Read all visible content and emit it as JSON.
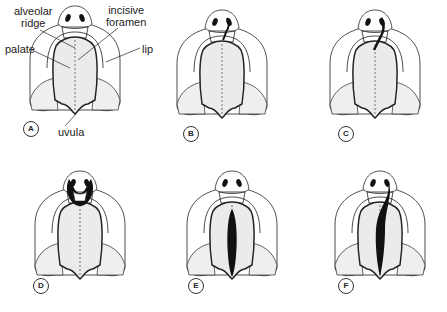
{
  "figure": {
    "panels": [
      {
        "id": "A",
        "label": "A",
        "cx": 75,
        "cy": 60,
        "cleft": "none",
        "letter_pos": [
          23,
          121
        ]
      },
      {
        "id": "B",
        "label": "B",
        "cx": 222,
        "cy": 64,
        "cleft": "unilateral-lip-incomplete",
        "letter_pos": [
          183,
          126
        ]
      },
      {
        "id": "C",
        "label": "C",
        "cx": 375,
        "cy": 64,
        "cleft": "unilateral-lip-and-alveolus",
        "letter_pos": [
          338,
          126
        ]
      },
      {
        "id": "D",
        "label": "D",
        "cx": 80,
        "cy": 225,
        "cleft": "bilateral-lip-and-primary-palate",
        "letter_pos": [
          33,
          278
        ]
      },
      {
        "id": "E",
        "label": "E",
        "cx": 232,
        "cy": 225,
        "cleft": "secondary-palate-only",
        "letter_pos": [
          188,
          278
        ]
      },
      {
        "id": "F",
        "label": "F",
        "cx": 380,
        "cy": 225,
        "cleft": "unilateral-complete",
        "letter_pos": [
          338,
          278
        ]
      }
    ],
    "annotations": [
      {
        "name": "alveolar-ridge",
        "text_lines": [
          "alveolar",
          "ridge"
        ],
        "x": 12,
        "y": 4
      },
      {
        "name": "incisive-foramen",
        "text_lines": [
          "incisive",
          "foramen"
        ],
        "x": 108,
        "y": 3
      },
      {
        "name": "palate",
        "text": "palate",
        "x": 5,
        "y": 42
      },
      {
        "name": "lip",
        "text": "lip",
        "x": 141,
        "y": 42
      },
      {
        "name": "uvula",
        "text": "uvula",
        "x": 58,
        "y": 124
      }
    ],
    "colors": {
      "line": "#222222",
      "palate_fill": "#ebebeb",
      "cleft_fill": "#111111",
      "background": "#ffffff"
    }
  }
}
